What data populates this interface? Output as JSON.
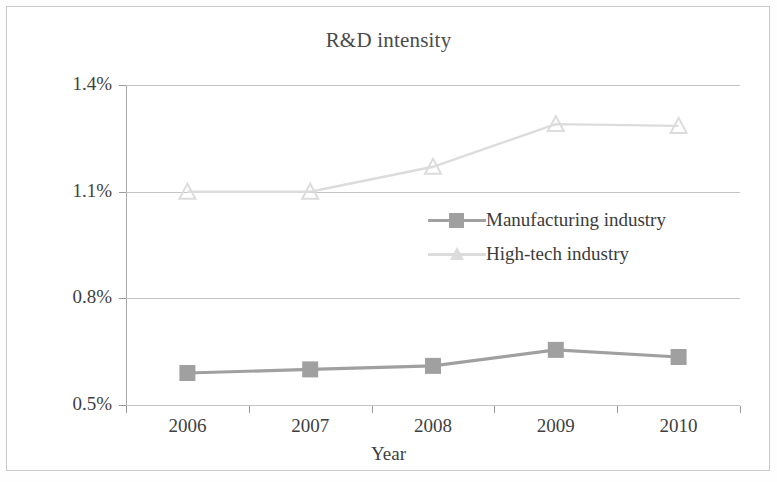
{
  "chart_data": {
    "type": "line",
    "title": "R&D intensity",
    "xlabel": "Year",
    "ylabel": "",
    "categories": [
      "2006",
      "2007",
      "2008",
      "2009",
      "2010"
    ],
    "ytick_labels": [
      "0.5%",
      "0.8%",
      "1.1%",
      "1.4%"
    ],
    "ytick_values": [
      0.5,
      0.8,
      1.1,
      1.4
    ],
    "ylim": [
      0.5,
      1.4
    ],
    "grid": "horizontal",
    "legend_position": "inside-center-right",
    "series": [
      {
        "name": "Manufacturing industry",
        "marker": "square",
        "color": "#a0a0a0",
        "values": [
          0.59,
          0.6,
          0.61,
          0.655,
          0.635
        ]
      },
      {
        "name": "High-tech industry",
        "marker": "triangle",
        "color": "#dcdcdc",
        "values": [
          1.1,
          1.1,
          1.17,
          1.29,
          1.285
        ]
      }
    ]
  },
  "legend": {
    "items": [
      {
        "label": "Manufacturing industry"
      },
      {
        "label": "High-tech industry"
      }
    ]
  },
  "colors": {
    "manufacturing": "#a0a0a0",
    "hightech": "#dcdcdc",
    "axis": "#a8a8a8",
    "grid": "#c4c4c4",
    "text": "#3f3f3f",
    "frame": "#c9c9c9"
  }
}
